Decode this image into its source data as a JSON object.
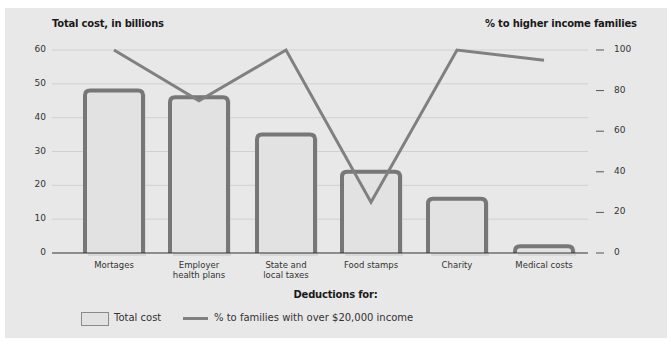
{
  "chart_data": {
    "type": "bar",
    "title": "",
    "xlabel": "Deductions for:",
    "ylabel": "Total cost, in billions",
    "y2label": "% to higher income families",
    "categories": [
      "Mortages",
      "Employer health plans",
      "State and local taxes",
      "Food stamps",
      "Charity",
      "Medical costs"
    ],
    "ylim": [
      0,
      60
    ],
    "y2lim": [
      0,
      100
    ],
    "yticks": [
      0,
      10,
      20,
      30,
      40,
      50,
      60
    ],
    "y2ticks": [
      0,
      20,
      40,
      60,
      80,
      100
    ],
    "grid": true,
    "legend_position": "bottom-left",
    "series": [
      {
        "name": "Total cost",
        "type": "bar",
        "axis": "left",
        "values": [
          48,
          46,
          35,
          24,
          16,
          2
        ]
      },
      {
        "name": "% to families with over $20,000 income",
        "type": "line",
        "axis": "right",
        "values": [
          100,
          75,
          100,
          25,
          100,
          95
        ]
      }
    ]
  },
  "labels": {
    "left_axis_title": "Total cost, in billions",
    "right_axis_title": "% to higher income families",
    "x_axis_title": "Deductions for:",
    "left_ticks": [
      "60",
      "50",
      "40",
      "30",
      "20",
      "10",
      "0"
    ],
    "right_ticks": [
      "100",
      "80",
      "60",
      "40",
      "20",
      "0"
    ],
    "categories": [
      {
        "line1": "Mortages",
        "line2": ""
      },
      {
        "line1": "Employer",
        "line2": "health plans"
      },
      {
        "line1": "State and",
        "line2": "local taxes"
      },
      {
        "line1": "Food stamps",
        "line2": ""
      },
      {
        "line1": "Charity",
        "line2": ""
      },
      {
        "line1": "Medical costs",
        "line2": ""
      }
    ],
    "legend": {
      "bar_label": "Total cost",
      "line_label": "% to families with over $20,000 income"
    }
  },
  "colors": {
    "background": "#e8e8e8",
    "bar_fill": "#e2e2e2",
    "bar_stroke": "#777777",
    "line": "#808080",
    "grid": "#d0d0d0",
    "axis": "#333333"
  }
}
